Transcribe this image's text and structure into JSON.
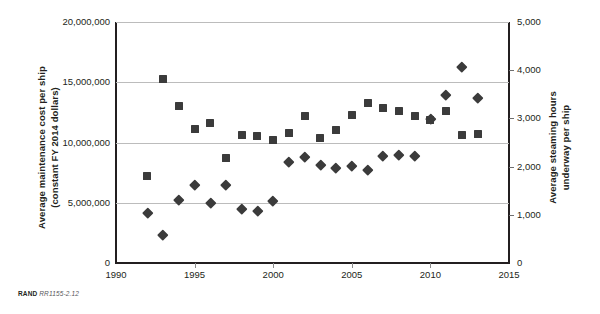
{
  "footer": {
    "brand": "RAND",
    "figure_id": "RR1155-2.12"
  },
  "axes": {
    "y_left_title": "Average maintenance cost per ship\n(constant FY 2014 dollars)",
    "y_right_title": "Average steaming hours\nunderway per ship",
    "x_title": ""
  },
  "chart_data": {
    "type": "scatter",
    "title": "",
    "subtitle": "",
    "xlabel": "",
    "ylabel": "Average maintenance cost per ship (constant FY 2014 dollars)",
    "y2label": "Average steaming hours underway per ship",
    "xlim": [
      1990,
      2015
    ],
    "ylim": [
      0,
      20000000
    ],
    "y2lim": [
      0,
      5000
    ],
    "grid": true,
    "legend": "none",
    "x_ticks": [
      1990,
      1995,
      2000,
      2005,
      2010,
      2015
    ],
    "x_tick_labels": [
      "1990",
      "1995",
      "2000",
      "2005",
      "2010",
      "2015"
    ],
    "y_ticks": [
      0,
      5000000,
      10000000,
      15000000,
      20000000
    ],
    "y_tick_labels": [
      "0",
      "5,000,000",
      "10,000,000",
      "15,000,000",
      "20,000,000"
    ],
    "y2_ticks": [
      0,
      1000,
      2000,
      3000,
      4000,
      5000
    ],
    "y2_tick_labels": [
      "0",
      "1,000",
      "2,000",
      "3,000",
      "4,000",
      "5,000"
    ],
    "series": [
      {
        "name": "Average maintenance cost per ship",
        "marker": "square",
        "axis": "left",
        "color": "#3b3b3b",
        "x": [
          1992,
          1993,
          1994,
          1995,
          1996,
          1997,
          1998,
          1999,
          2000,
          2001,
          2002,
          2003,
          2004,
          2005,
          2006,
          2007,
          2008,
          2009,
          2010,
          2011,
          2012,
          2013
        ],
        "values": [
          7200000,
          15300000,
          13000000,
          11100000,
          11600000,
          8700000,
          10600000,
          10500000,
          10200000,
          10800000,
          12200000,
          10400000,
          11000000,
          12300000,
          13300000,
          12900000,
          12600000,
          12200000,
          11900000,
          12600000,
          10600000,
          10700000
        ]
      },
      {
        "name": "Average steaming hours underway per ship",
        "marker": "diamond",
        "axis": "right",
        "color": "#3b3b3b",
        "x": [
          1992,
          1993,
          1994,
          1995,
          1996,
          1997,
          1998,
          1999,
          2000,
          2001,
          2002,
          2003,
          2004,
          2005,
          2006,
          2007,
          2008,
          2009,
          2010,
          2011,
          2012,
          2013
        ],
        "values": [
          1050,
          580,
          1310,
          1620,
          1250,
          1620,
          1120,
          1080,
          1300,
          2090,
          2200,
          2030,
          1970,
          2020,
          1930,
          2230,
          2250,
          2220,
          3000,
          3480,
          4080,
          3430
        ]
      }
    ]
  }
}
